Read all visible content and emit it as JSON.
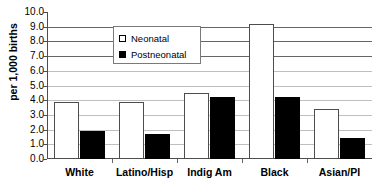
{
  "chart_data": {
    "type": "bar",
    "title": "",
    "subtitle": "",
    "xlabel": "",
    "ylabel": "per 1,000 births",
    "ylim": [
      0.0,
      10.0
    ],
    "ytick_step": 1.0,
    "ytick_labels": [
      "10.0",
      "9.0",
      "8.0",
      "7.0",
      "6.0",
      "5.0",
      "4.0",
      "3.0",
      "2.0",
      "1.0",
      "0.0"
    ],
    "ytick_values": [
      10.0,
      9.0,
      8.0,
      7.0,
      6.0,
      5.0,
      4.0,
      3.0,
      2.0,
      1.0,
      0.0
    ],
    "grid": true,
    "grid_axis": "y",
    "legend_position": "top-left-inside",
    "categories": [
      "White",
      "Latino/Hisp",
      "Indig Am",
      "Black",
      "Asian/PI"
    ],
    "series": [
      {
        "name": "Neonatal",
        "color": "#ffffff",
        "edge_color": "#4d4d4d",
        "values": [
          3.9,
          3.9,
          4.5,
          9.2,
          3.4
        ]
      },
      {
        "name": "Postneonatal",
        "color": "#000000",
        "edge_color": "#000000",
        "values": [
          1.9,
          1.7,
          4.2,
          4.25,
          1.4
        ]
      }
    ]
  },
  "legend": {
    "items": [
      {
        "label": "Neonatal",
        "swatch": "open-square-icon"
      },
      {
        "label": "Postneonatal",
        "swatch": "filled-square-icon"
      }
    ]
  },
  "colors": {
    "axis": "#4d4d4d",
    "grid": "#888888",
    "neonatal": "#ffffff",
    "postneonatal": "#000000",
    "text": "#000000",
    "background": "#ffffff"
  }
}
